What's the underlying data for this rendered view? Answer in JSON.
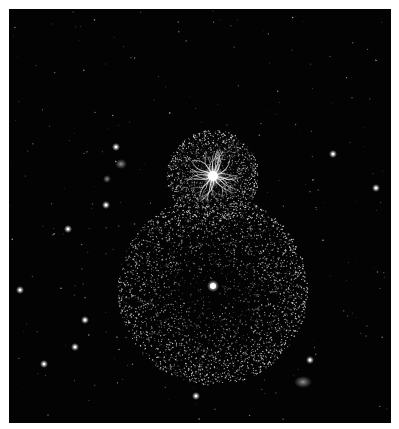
{
  "image": {
    "description": "Illustration of a small bright sphere with branching filaments above a larger dotted sphere against a starfield",
    "canvas": {
      "width": 399,
      "height": 429
    },
    "frame": {
      "x": 9,
      "y": 9,
      "width": 382,
      "height": 414,
      "background": "#030303",
      "border_color": "#ffffff"
    }
  },
  "spheres": [
    {
      "name": "small-filament-sphere",
      "cx": 213,
      "cy": 176,
      "r": 46,
      "core": {
        "r": 5,
        "color": "#ffffff"
      },
      "dot_color": "#e8e8e8",
      "filaments": 14
    },
    {
      "name": "large-dotted-sphere",
      "cx": 213,
      "cy": 290,
      "r": 95,
      "core": {
        "r": 3,
        "color": "#ffffff"
      },
      "dot_color": "#dcdcdc"
    }
  ],
  "bright_stars": [
    {
      "x": 116,
      "y": 147
    },
    {
      "x": 333,
      "y": 154
    },
    {
      "x": 106,
      "y": 205
    },
    {
      "x": 68,
      "y": 229
    },
    {
      "x": 85,
      "y": 320
    },
    {
      "x": 75,
      "y": 347
    },
    {
      "x": 44,
      "y": 364
    },
    {
      "x": 310,
      "y": 360
    },
    {
      "x": 196,
      "y": 396
    },
    {
      "x": 376,
      "y": 188
    },
    {
      "x": 20,
      "y": 290
    }
  ],
  "nebulae": [
    {
      "x": 121,
      "y": 164,
      "rx": 6,
      "ry": 5
    },
    {
      "x": 107,
      "y": 179,
      "rx": 4,
      "ry": 4
    },
    {
      "x": 303,
      "y": 382,
      "rx": 9,
      "ry": 6
    }
  ]
}
